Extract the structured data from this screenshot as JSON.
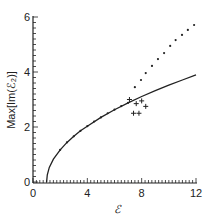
{
  "chart_data": {
    "type": "line",
    "title": "",
    "xlabel": "ℰ",
    "ylabel": "Max[Im(ℰ₂)]",
    "xlim": [
      0,
      12
    ],
    "ylim": [
      0,
      6
    ],
    "x_ticks": [
      "0",
      "4",
      "8",
      "12"
    ],
    "y_ticks": [
      "0",
      "2",
      "4",
      "6"
    ],
    "grid": false,
    "legend": null,
    "series": [
      {
        "name": "analytic (solid)",
        "style": "solid-line",
        "x": [
          1.0,
          1.05,
          1.2,
          1.5,
          2,
          2.5,
          3,
          3.5,
          4,
          5,
          6,
          7,
          8,
          9,
          10,
          11,
          12
        ],
        "values": [
          0,
          0.26,
          0.53,
          0.83,
          1.17,
          1.44,
          1.66,
          1.86,
          2.03,
          2.35,
          2.63,
          2.88,
          3.11,
          3.32,
          3.52,
          3.71,
          3.9
        ]
      },
      {
        "name": "numerical (dots)",
        "style": "dots",
        "x": [
          2.0,
          2.5,
          3.0,
          3.5,
          4.0,
          4.5,
          5.0,
          5.5,
          6.0,
          6.5,
          7.0,
          7.5,
          7.95,
          8.3,
          8.76,
          9.2,
          9.65,
          10.1,
          10.5,
          10.97,
          11.4,
          11.86
        ],
        "values": [
          1.17,
          1.44,
          1.66,
          1.86,
          2.03,
          2.2,
          2.35,
          2.5,
          2.63,
          2.76,
          2.88,
          3.45,
          3.71,
          3.96,
          4.22,
          4.47,
          4.69,
          4.95,
          5.16,
          5.35,
          5.53,
          5.71
        ]
      },
      {
        "name": "numerical (crosses)",
        "style": "plus-markers",
        "x": [
          7.1,
          7.6,
          8.0,
          8.3,
          7.4,
          7.8
        ],
        "values": [
          3.0,
          2.85,
          2.95,
          2.75,
          2.5,
          2.5
        ]
      }
    ]
  }
}
